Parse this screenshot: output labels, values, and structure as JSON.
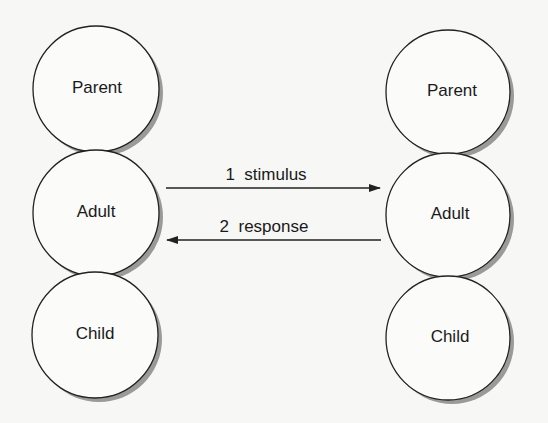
{
  "left_person": {
    "states": [
      {
        "label": "Parent",
        "cx": 96,
        "cy": 89
      },
      {
        "label": "Adult",
        "cx": 96,
        "cy": 213
      },
      {
        "label": "Child",
        "cx": 95,
        "cy": 335
      }
    ]
  },
  "right_person": {
    "states": [
      {
        "label": "Parent",
        "cx": 448,
        "cy": 92
      },
      {
        "label": "Adult",
        "cx": 448,
        "cy": 215
      },
      {
        "label": "Child",
        "cx": 448,
        "cy": 338
      }
    ]
  },
  "transactions": [
    {
      "number": "1",
      "label": "stimulus",
      "text": "1  stimulus",
      "direction": "left-to-right",
      "from": "Adult",
      "to": "Adult"
    },
    {
      "number": "2",
      "label": "response",
      "text": "2  response",
      "direction": "right-to-left",
      "from": "Adult",
      "to": "Adult"
    }
  ]
}
